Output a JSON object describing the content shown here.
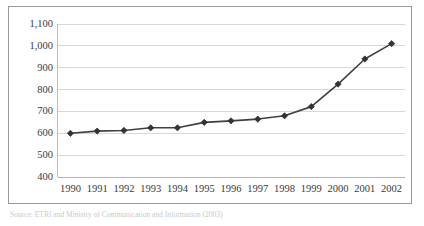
{
  "chart_data": {
    "type": "line",
    "title": "",
    "subtitle": "",
    "xlabel": "",
    "ylabel": "",
    "categories": [
      "1990",
      "1991",
      "1992",
      "1993",
      "1994",
      "1995",
      "1996",
      "1997",
      "1998",
      "1999",
      "2000",
      "2001",
      "2002"
    ],
    "values": [
      600,
      610,
      613,
      625,
      625,
      650,
      657,
      665,
      680,
      722,
      825,
      940,
      1010
    ],
    "series": [
      {
        "name": "",
        "values": [
          600,
          610,
          613,
          625,
          625,
          650,
          657,
          665,
          680,
          722,
          825,
          940,
          1010
        ]
      }
    ],
    "ylim": [
      400,
      1100
    ],
    "y_ticks": [
      400,
      500,
      600,
      700,
      800,
      900,
      1000,
      1100
    ],
    "y_tick_labels": [
      "400",
      "500",
      "600",
      "700",
      "800",
      "900",
      "1,000",
      "1,100"
    ],
    "x_tick_labels": [
      "1990",
      "1991",
      "1992",
      "1993",
      "1994",
      "1995",
      "1996",
      "1997",
      "1998",
      "1999",
      "2000",
      "2001",
      "2002"
    ],
    "grid": true,
    "legend": false,
    "legend_position": "none",
    "marker": "diamond",
    "line_color": "#404040",
    "marker_color": "#333333",
    "grid_color": "#d8d8d8",
    "annotations": []
  },
  "caption": {
    "text": "Source: ETRI and Ministry of Communication and Information (2003)"
  },
  "colors": {
    "frame": "#9a9a9a",
    "background": "#ffffff",
    "tick_text": "#3a3a3a"
  }
}
